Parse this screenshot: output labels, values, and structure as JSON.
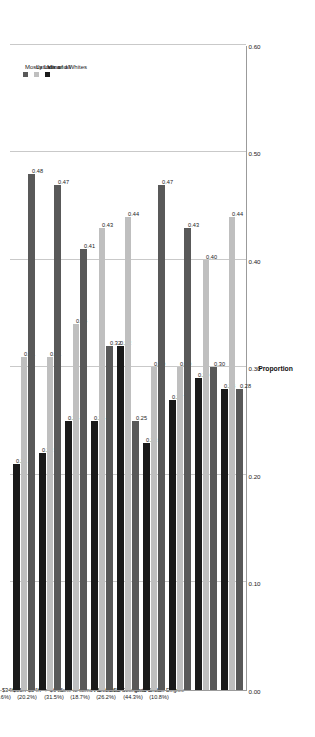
{
  "chart_data": {
    "type": "bar",
    "orientation": "horizontal",
    "title": "",
    "xlabel": "",
    "ylabel": "Proportion",
    "ylim": [
      0.0,
      0.6
    ],
    "grid": true,
    "legend_position": "top-right",
    "tick_labels": [
      "0.00",
      "0.10",
      "0.20",
      "0.30",
      "0.40",
      "0.50",
      "0.60"
    ],
    "tick_values": [
      0.0,
      0.1,
      0.2,
      0.3,
      0.4,
      0.5,
      0.6
    ],
    "categories": [
      "< $15K (12.0%)",
      "$15K-$24K (18.6%)",
      "$25K-$34K (17.6%)",
      "$35K-$54K (20.2%)",
      "> $64K (31.5%)",
      "None to some HS (18.7%)",
      "H-S or GED (26.2%)",
      "Some College to Grad (44.3%)",
      "Grad or Prof Degree (10.8%)"
    ],
    "series": [
      {
        "name": "Mostly Latino",
        "color": "#595959",
        "values": [
          0.48,
          0.47,
          0.41,
          0.32,
          0.25,
          0.47,
          0.43,
          0.3,
          0.28
        ],
        "labels": [
          "0.48",
          "0.47",
          "0.41",
          "0.32",
          "0.25",
          "0.47",
          "0.43",
          "0.30",
          "0.28"
        ]
      },
      {
        "name": "Latinos and Whites",
        "color": "#bfbfbf",
        "values": [
          0.31,
          0.31,
          0.34,
          0.43,
          0.44,
          0.3,
          0.3,
          0.4,
          0.44
        ],
        "labels": [
          "0.31",
          "0.31",
          "0.34",
          "0.43",
          "0.44",
          "0.30",
          "0.30",
          "0.40",
          "0.44"
        ]
      },
      {
        "name": "Mix of all",
        "color": "#1a1a1a",
        "values": [
          0.21,
          0.22,
          0.25,
          0.25,
          0.32,
          0.23,
          0.27,
          0.29,
          0.28
        ],
        "labels": [
          "0.21",
          "0.22",
          "0.25",
          "0.25",
          "0.32",
          "0.23",
          "0.27",
          "0.29",
          "0.28"
        ]
      }
    ]
  },
  "axis": {
    "value_axis_title": "Proportion"
  },
  "legend": {
    "items": [
      {
        "label": "Mostly Latino",
        "color": "#595959"
      },
      {
        "label": "Latinos and Whites",
        "color": "#bfbfbf"
      },
      {
        "label": "Mix of all",
        "color": "#1a1a1a"
      }
    ]
  },
  "colors": {
    "mostly_latino": "#595959",
    "latinos_and_whites": "#bfbfbf",
    "mix_of_all": "#1a1a1a",
    "axis": "#9b9b9b",
    "grid": "#c9c9c9",
    "background": "#ffffff"
  }
}
